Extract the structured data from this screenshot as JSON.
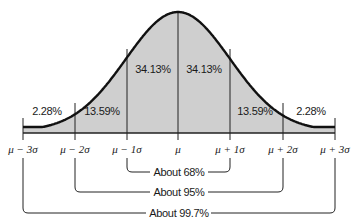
{
  "chart_data": {
    "type": "area",
    "x_ticks": [
      "μ − 3σ",
      "μ − 2σ",
      "μ − 1σ",
      "μ",
      "μ + 1σ",
      "μ + 2σ",
      "μ + 3σ"
    ],
    "regions": [
      {
        "from": "μ − 3σ",
        "to": "μ − 2σ",
        "label": "2.28%",
        "value": 2.28
      },
      {
        "from": "μ − 2σ",
        "to": "μ − 1σ",
        "label": "13.59%",
        "value": 13.59
      },
      {
        "from": "μ − 1σ",
        "to": "μ",
        "label": "34.13%",
        "value": 34.13
      },
      {
        "from": "μ",
        "to": "μ + 1σ",
        "label": "34.13%",
        "value": 34.13
      },
      {
        "from": "μ + 1σ",
        "to": "μ + 2σ",
        "label": "13.59%",
        "value": 13.59
      },
      {
        "from": "μ + 2σ",
        "to": "μ + 3σ",
        "label": "2.28%",
        "value": 2.28
      }
    ],
    "brackets": [
      {
        "from": "μ − 1σ",
        "to": "μ + 1σ",
        "label": "About 68%"
      },
      {
        "from": "μ − 2σ",
        "to": "μ + 2σ",
        "label": "About 95%"
      },
      {
        "from": "μ − 3σ",
        "to": "μ + 3σ",
        "label": "About 99.7%"
      }
    ],
    "fill_color": "#cfcfcf",
    "line_color": "#111111"
  },
  "labels": {
    "r0": "2.28%",
    "r1": "13.59%",
    "r2": "34.13%",
    "r3": "34.13%",
    "r4": "13.59%",
    "r5": "2.28%",
    "t0": "μ − 3σ",
    "t1": "μ − 2σ",
    "t2": "μ − 1σ",
    "t3": "μ",
    "t4": "μ + 1σ",
    "t5": "μ + 2σ",
    "t6": "μ + 3σ",
    "b68": "About 68%",
    "b95": "About 95%",
    "b997": "About 99.7%"
  }
}
